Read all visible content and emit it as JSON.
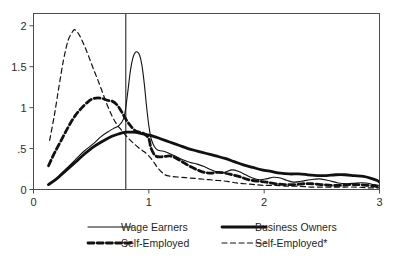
{
  "chart_data": {
    "type": "line",
    "title": "",
    "subtitle": "",
    "xlabel": "",
    "ylabel": "",
    "xlim": [
      0,
      3
    ],
    "ylim": [
      0,
      2.15
    ],
    "grid": false,
    "legend_position": "bottom",
    "x_ticks": [
      "0",
      "1",
      "2",
      "3"
    ],
    "x_tick_values": [
      0,
      1,
      2,
      3
    ],
    "y_ticks": [
      "0",
      ".5",
      "1",
      "1.5",
      "2"
    ],
    "y_tick_values": [
      0,
      0.5,
      1,
      1.5,
      2
    ],
    "annotations": [
      {
        "name": "vertical-reference-line",
        "type": "vline",
        "x": 0.8
      }
    ],
    "series": [
      {
        "name": "Wage Earners",
        "style": "thin-solid",
        "x": [
          0.13,
          0.2,
          0.28,
          0.36,
          0.44,
          0.52,
          0.58,
          0.64,
          0.7,
          0.74,
          0.78,
          0.8,
          0.82,
          0.84,
          0.86,
          0.88,
          0.9,
          0.92,
          0.94,
          0.96,
          0.98,
          1.0,
          1.02,
          1.05,
          1.08,
          1.12,
          1.18,
          1.24,
          1.3,
          1.36,
          1.42,
          1.48,
          1.54,
          1.6,
          1.66,
          1.72,
          1.78,
          1.84,
          1.9,
          1.96,
          2.02,
          2.08,
          2.14,
          2.2,
          2.26,
          2.32,
          2.4,
          2.48,
          2.56,
          2.64,
          2.72,
          2.8,
          2.88,
          2.95,
          3.0
        ],
        "y": [
          0.06,
          0.14,
          0.25,
          0.36,
          0.47,
          0.56,
          0.64,
          0.7,
          0.75,
          0.78,
          0.86,
          1.0,
          1.22,
          1.45,
          1.6,
          1.67,
          1.68,
          1.64,
          1.52,
          1.3,
          1.02,
          0.78,
          0.62,
          0.52,
          0.48,
          0.47,
          0.44,
          0.4,
          0.36,
          0.33,
          0.31,
          0.28,
          0.24,
          0.21,
          0.21,
          0.24,
          0.22,
          0.18,
          0.14,
          0.12,
          0.13,
          0.15,
          0.14,
          0.11,
          0.09,
          0.1,
          0.12,
          0.13,
          0.11,
          0.08,
          0.07,
          0.08,
          0.08,
          0.06,
          0.05
        ]
      },
      {
        "name": "Business Owners",
        "style": "thick-solid",
        "x": [
          0.13,
          0.2,
          0.28,
          0.36,
          0.44,
          0.52,
          0.6,
          0.68,
          0.74,
          0.8,
          0.86,
          0.92,
          0.98,
          1.04,
          1.1,
          1.18,
          1.26,
          1.34,
          1.42,
          1.5,
          1.58,
          1.66,
          1.74,
          1.82,
          1.9,
          1.98,
          2.06,
          2.14,
          2.22,
          2.3,
          2.38,
          2.46,
          2.54,
          2.62,
          2.7,
          2.78,
          2.86,
          2.92,
          2.98,
          3.0
        ],
        "y": [
          0.06,
          0.13,
          0.23,
          0.33,
          0.43,
          0.52,
          0.59,
          0.65,
          0.68,
          0.7,
          0.7,
          0.69,
          0.67,
          0.65,
          0.62,
          0.58,
          0.54,
          0.5,
          0.47,
          0.44,
          0.41,
          0.38,
          0.34,
          0.3,
          0.27,
          0.24,
          0.22,
          0.2,
          0.19,
          0.19,
          0.18,
          0.17,
          0.17,
          0.18,
          0.18,
          0.17,
          0.16,
          0.14,
          0.11,
          0.09
        ]
      },
      {
        "name": "Self-Employed",
        "style": "thick-dashed",
        "x": [
          0.13,
          0.18,
          0.24,
          0.3,
          0.36,
          0.42,
          0.48,
          0.52,
          0.56,
          0.6,
          0.64,
          0.68,
          0.72,
          0.76,
          0.8,
          0.84,
          0.88,
          0.92,
          0.96,
          1.0,
          1.02,
          1.06,
          1.12,
          1.18,
          1.24,
          1.3,
          1.36,
          1.42,
          1.48,
          1.54,
          1.6,
          1.66,
          1.72,
          1.78,
          1.84,
          1.9,
          1.96,
          2.02,
          2.1,
          2.18,
          2.26,
          2.34,
          2.42,
          2.5,
          2.58,
          2.66,
          2.74,
          2.82,
          2.9,
          2.96,
          3.0
        ],
        "y": [
          0.29,
          0.44,
          0.6,
          0.76,
          0.9,
          1.0,
          1.08,
          1.11,
          1.12,
          1.11,
          1.09,
          1.08,
          1.04,
          0.96,
          0.86,
          0.78,
          0.72,
          0.7,
          0.68,
          0.62,
          0.5,
          0.41,
          0.4,
          0.41,
          0.38,
          0.33,
          0.28,
          0.24,
          0.21,
          0.2,
          0.21,
          0.2,
          0.18,
          0.16,
          0.13,
          0.11,
          0.1,
          0.09,
          0.07,
          0.06,
          0.06,
          0.07,
          0.07,
          0.06,
          0.05,
          0.05,
          0.06,
          0.06,
          0.05,
          0.04,
          0.03
        ]
      },
      {
        "name": "Self-Employed*",
        "style": "thin-dashed",
        "x": [
          0.14,
          0.18,
          0.22,
          0.26,
          0.3,
          0.34,
          0.36,
          0.4,
          0.44,
          0.48,
          0.52,
          0.56,
          0.6,
          0.64,
          0.68,
          0.72,
          0.76,
          0.8,
          0.84,
          0.88,
          0.92,
          0.96,
          1.0,
          1.04,
          1.08,
          1.14,
          1.2,
          1.28,
          1.36,
          1.44,
          1.52,
          1.6,
          1.68,
          1.76,
          1.84,
          1.92,
          2.0,
          2.1,
          2.2,
          2.3,
          2.4,
          2.5,
          2.6,
          2.7,
          2.8,
          2.9,
          3.0
        ],
        "y": [
          0.6,
          0.9,
          1.25,
          1.58,
          1.82,
          1.93,
          1.95,
          1.88,
          1.76,
          1.62,
          1.47,
          1.33,
          1.18,
          1.03,
          0.9,
          0.8,
          0.73,
          0.66,
          0.6,
          0.55,
          0.5,
          0.46,
          0.41,
          0.34,
          0.26,
          0.18,
          0.16,
          0.15,
          0.14,
          0.13,
          0.12,
          0.11,
          0.1,
          0.08,
          0.07,
          0.06,
          0.05,
          0.05,
          0.04,
          0.04,
          0.03,
          0.03,
          0.03,
          0.03,
          0.03,
          0.02,
          0.02
        ]
      }
    ],
    "legend_entries": [
      {
        "label": "Wage Earners",
        "style": "thin-solid"
      },
      {
        "label": "Business Owners",
        "style": "thick-solid"
      },
      {
        "label": "Self-Employed",
        "style": "thick-dashed"
      },
      {
        "label": "Self-Employed*",
        "style": "thin-dashed"
      }
    ]
  }
}
